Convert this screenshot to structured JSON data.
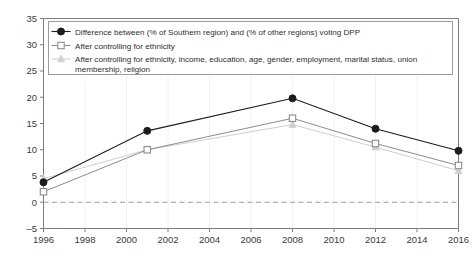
{
  "chart_data": {
    "type": "line",
    "title": "",
    "subtitle": "",
    "xlabel": "",
    "ylabel": "",
    "x": [
      1996,
      2001,
      2008,
      2012,
      2016
    ],
    "xlim": [
      1996,
      2016
    ],
    "ylim": [
      -5,
      35
    ],
    "xticks": [
      "1996",
      "1998",
      "2000",
      "2002",
      "2004",
      "2006",
      "2008",
      "2010",
      "2012",
      "2014",
      "2016"
    ],
    "xtick_values": [
      1996,
      1998,
      2000,
      2002,
      2004,
      2006,
      2008,
      2010,
      2012,
      2014,
      2016
    ],
    "yticks": [
      "35",
      "30",
      "25",
      "20",
      "15",
      "10",
      "5",
      "0",
      "-5"
    ],
    "ytick_values": [
      35,
      30,
      25,
      20,
      15,
      10,
      5,
      0,
      -5
    ],
    "grid": "faint-vertical",
    "legend_position": "top-inside",
    "zero_line": {
      "value": 0,
      "style": "dashed",
      "color": "#9a9a9a"
    },
    "series": [
      {
        "name": "Difference between (% of Southern region) and (% of other regions) voting DPP",
        "marker": "filled-circle",
        "color": "#1c1c1c",
        "values": [
          3.8,
          13.6,
          19.8,
          14.0,
          9.8
        ]
      },
      {
        "name": "After controlling for ethnicity",
        "marker": "open-square",
        "color": "#8c8c8c",
        "values": [
          2.0,
          10.0,
          16.0,
          11.2,
          7.0
        ]
      },
      {
        "name": "After controlling for ethnicity, income, education, age, gender, employment, marital status, union membership, religion",
        "marker": "filled-triangle",
        "color": "#cfcfcf",
        "values": [
          4.5,
          10.0,
          14.8,
          10.5,
          6.0
        ]
      }
    ]
  },
  "legend": {
    "items": [
      {
        "label": "Difference between (% of Southern region) and (% of other regions) voting DPP",
        "marker_name": "legend-marker-filled-circle"
      },
      {
        "label": "After controlling for ethnicity",
        "marker_name": "legend-marker-open-square"
      },
      {
        "label": "After controlling for ethnicity, income, education, age, gender, employment, marital status, union",
        "label_line2": "membership, religion",
        "marker_name": "legend-marker-filled-triangle"
      }
    ]
  },
  "colors": {
    "series1": "#1c1c1c",
    "series2": "#8c8c8c",
    "series3": "#cfcfcf",
    "axis": "#7d7d7d",
    "grid": "#f2f2f2",
    "zero_line": "#9a9a9a",
    "text": "#3a3a3a",
    "background": "#ffffff"
  }
}
